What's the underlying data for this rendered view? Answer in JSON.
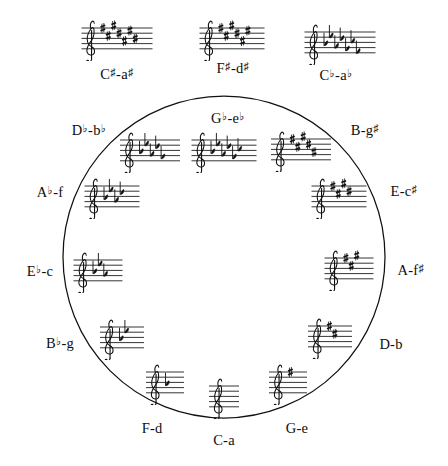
{
  "figure": {
    "name": "circle-of-fifths",
    "ink_color": "#111111",
    "background_color": "#ffffff",
    "circle": {
      "cx": 224,
      "cy": 257,
      "r": 161
    }
  },
  "chart_data": {
    "type": "diagram",
    "title": "",
    "subtitle": "",
    "xlabel": "",
    "ylabel": "",
    "grid": false,
    "legend": "none",
    "categories": [
      "C-a",
      "G-e",
      "D-b",
      "A-f♯",
      "E-c♯",
      "B-g♯",
      "F♯-d♯",
      "C♯-a♯",
      "C♭-a♭",
      "G♭-e♭",
      "D♭-b♭",
      "A♭-f",
      "E♭-c",
      "B♭-g",
      "F-d"
    ],
    "values": [
      0,
      1,
      2,
      3,
      4,
      5,
      6,
      7,
      7,
      6,
      5,
      4,
      3,
      2,
      1
    ],
    "series": [
      {
        "name": "accidental_count",
        "values": [
          0,
          1,
          2,
          3,
          4,
          5,
          6,
          7,
          7,
          6,
          5,
          4,
          3,
          2,
          1
        ]
      }
    ]
  },
  "nodes": [
    {
      "id": "c-major",
      "major": "C",
      "major_accidental": "",
      "minor": "a",
      "minor_accidental": "",
      "label": "C-a",
      "accidental_type": "none",
      "accidental_count": 0,
      "on_circle": true,
      "staff": {
        "x": 224,
        "y": 396
      },
      "label_pos": {
        "x": 224,
        "y": 440
      }
    },
    {
      "id": "g-major",
      "major": "G",
      "major_accidental": "",
      "minor": "e",
      "minor_accidental": "",
      "label": "G-e",
      "accidental_type": "sharp",
      "accidental_count": 1,
      "on_circle": true,
      "staff": {
        "x": 288,
        "y": 382
      },
      "label_pos": {
        "x": 297,
        "y": 428
      }
    },
    {
      "id": "d-major",
      "major": "D",
      "major_accidental": "",
      "minor": "b",
      "minor_accidental": "",
      "label": "D-b",
      "accidental_type": "sharp",
      "accidental_count": 2,
      "on_circle": true,
      "staff": {
        "x": 330,
        "y": 336
      },
      "label_pos": {
        "x": 391,
        "y": 344
      }
    },
    {
      "id": "a-major",
      "major": "A",
      "major_accidental": "",
      "minor": "f",
      "minor_accidental": "♯",
      "label": "A-f♯",
      "accidental_type": "sharp",
      "accidental_count": 3,
      "on_circle": true,
      "staff": {
        "x": 349,
        "y": 268
      },
      "label_pos": {
        "x": 411,
        "y": 270
      }
    },
    {
      "id": "e-major",
      "major": "E",
      "major_accidental": "",
      "minor": "c",
      "minor_accidental": "♯",
      "label": "E-c♯",
      "accidental_type": "sharp",
      "accidental_count": 4,
      "on_circle": true,
      "staff": {
        "x": 339,
        "y": 196
      },
      "label_pos": {
        "x": 404,
        "y": 191
      }
    },
    {
      "id": "b-major",
      "major": "B",
      "major_accidental": "",
      "minor": "g",
      "minor_accidental": "♯",
      "label": "B-g♯",
      "accidental_type": "sharp",
      "accidental_count": 5,
      "on_circle": true,
      "staff": {
        "x": 301,
        "y": 149
      },
      "label_pos": {
        "x": 365,
        "y": 130
      }
    },
    {
      "id": "f-sharp-major",
      "major": "F",
      "major_accidental": "♯",
      "minor": "d",
      "minor_accidental": "♯",
      "label": "F♯-d♯",
      "accidental_type": "sharp",
      "accidental_count": 6,
      "on_circle": false,
      "staff": {
        "x": 232,
        "y": 38
      },
      "label_pos": {
        "x": 233,
        "y": 68
      }
    },
    {
      "id": "c-sharp-major",
      "major": "C",
      "major_accidental": "♯",
      "minor": "a",
      "minor_accidental": "♯",
      "label": "C♯-a♯",
      "accidental_type": "sharp",
      "accidental_count": 7,
      "on_circle": false,
      "staff": {
        "x": 117,
        "y": 38
      },
      "label_pos": {
        "x": 117,
        "y": 74
      }
    },
    {
      "id": "c-flat-major",
      "major": "C",
      "major_accidental": "♭",
      "minor": "a",
      "minor_accidental": "♭",
      "label": "C♭-a♭",
      "accidental_type": "flat",
      "accidental_count": 7,
      "on_circle": false,
      "staff": {
        "x": 340,
        "y": 42
      },
      "label_pos": {
        "x": 336,
        "y": 75
      }
    },
    {
      "id": "g-flat-major",
      "major": "G",
      "major_accidental": "♭",
      "minor": "e",
      "minor_accidental": "♭",
      "label": "G♭-e♭",
      "accidental_type": "flat",
      "accidental_count": 6,
      "on_circle": false,
      "staff": {
        "x": 224,
        "y": 150
      },
      "label_pos": {
        "x": 228,
        "y": 118
      }
    },
    {
      "id": "d-flat-major",
      "major": "D",
      "major_accidental": "♭",
      "minor": "b",
      "minor_accidental": "♭",
      "label": "D♭-b♭",
      "accidental_type": "flat",
      "accidental_count": 5,
      "on_circle": true,
      "staff": {
        "x": 150,
        "y": 150
      },
      "label_pos": {
        "x": 89,
        "y": 130
      }
    },
    {
      "id": "a-flat-major",
      "major": "A",
      "major_accidental": "♭",
      "minor": "f",
      "minor_accidental": "",
      "label": "A♭-f",
      "accidental_type": "flat",
      "accidental_count": 4,
      "on_circle": true,
      "staff": {
        "x": 112,
        "y": 196
      },
      "label_pos": {
        "x": 50,
        "y": 192
      }
    },
    {
      "id": "e-flat-major",
      "major": "E",
      "major_accidental": "♭",
      "minor": "c",
      "minor_accidental": "",
      "label": "E♭-c",
      "accidental_type": "flat",
      "accidental_count": 3,
      "on_circle": true,
      "staff": {
        "x": 98,
        "y": 270
      },
      "label_pos": {
        "x": 40,
        "y": 271
      }
    },
    {
      "id": "b-flat-major",
      "major": "B",
      "major_accidental": "♭",
      "minor": "g",
      "minor_accidental": "",
      "label": "B♭-g",
      "accidental_type": "flat",
      "accidental_count": 2,
      "on_circle": true,
      "staff": {
        "x": 122,
        "y": 337
      },
      "label_pos": {
        "x": 60,
        "y": 343
      }
    },
    {
      "id": "f-major",
      "major": "F",
      "major_accidental": "",
      "minor": "d",
      "minor_accidental": "",
      "label": "F-d",
      "accidental_type": "flat",
      "accidental_count": 1,
      "on_circle": true,
      "staff": {
        "x": 165,
        "y": 382
      },
      "label_pos": {
        "x": 152,
        "y": 428
      }
    }
  ]
}
